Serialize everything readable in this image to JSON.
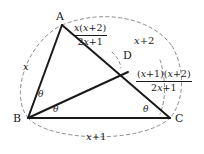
{
  "figure": {
    "background_color": "#ffffff",
    "line_color": "#1a1a1a",
    "dashed_color": "#8a8a8a"
  },
  "vertices": [
    {
      "key": "A",
      "label": "A"
    },
    {
      "key": "B",
      "label": "B"
    },
    {
      "key": "C",
      "label": "C"
    },
    {
      "key": "D",
      "label": "D"
    }
  ],
  "angles": [
    {
      "key": "abd",
      "label": "θ"
    },
    {
      "key": "dbc",
      "label": "θ"
    },
    {
      "key": "bca",
      "label": "θ"
    }
  ],
  "side_labels": {
    "ab": "x",
    "bc_prefix": "x",
    "bc_op": "+",
    "bc_suffix": "1",
    "ac_prefix": "x",
    "ac_op": "+",
    "ac_suffix": "2"
  },
  "segment_labels": {
    "ad": {
      "numerator_pre": "x",
      "numerator_paren_open": "(",
      "numerator_var": "x",
      "numerator_op": "+",
      "numerator_const": "2",
      "numerator_paren_close": ")",
      "denominator_coef": "2",
      "denominator_var": "x",
      "denominator_op": "+",
      "denominator_const": "1"
    },
    "dc": {
      "numerator_p1_open": "(",
      "numerator_p1_var": "x",
      "numerator_p1_op": "+",
      "numerator_p1_const": "1",
      "numerator_p1_close": ")",
      "numerator_p2_open": "(",
      "numerator_p2_var": "x",
      "numerator_p2_op": "+",
      "numerator_p2_const": "2",
      "numerator_p2_close": ")",
      "denominator_coef": "2",
      "denominator_var": "x",
      "denominator_op": "+",
      "denominator_const": "1"
    }
  }
}
